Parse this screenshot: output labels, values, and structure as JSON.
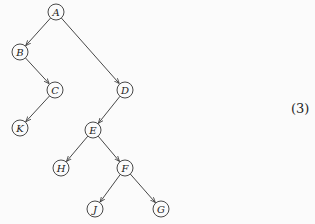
{
  "diagram": {
    "type": "binary-tree",
    "nodes": [
      {
        "id": "A",
        "label": "A",
        "x": 56,
        "y": 12
      },
      {
        "id": "B",
        "label": "B",
        "x": 20,
        "y": 52
      },
      {
        "id": "C",
        "label": "C",
        "x": 55,
        "y": 90
      },
      {
        "id": "K",
        "label": "K",
        "x": 20,
        "y": 128
      },
      {
        "id": "D",
        "label": "D",
        "x": 125,
        "y": 90
      },
      {
        "id": "E",
        "label": "E",
        "x": 93,
        "y": 130
      },
      {
        "id": "H",
        "label": "H",
        "x": 61,
        "y": 168
      },
      {
        "id": "F",
        "label": "F",
        "x": 125,
        "y": 168
      },
      {
        "id": "J",
        "label": "J",
        "x": 95,
        "y": 209
      },
      {
        "id": "G",
        "label": "G",
        "x": 161,
        "y": 209
      }
    ],
    "edges": [
      {
        "from": "A",
        "to": "B"
      },
      {
        "from": "A",
        "to": "D"
      },
      {
        "from": "B",
        "to": "C"
      },
      {
        "from": "C",
        "to": "K"
      },
      {
        "from": "D",
        "to": "E"
      },
      {
        "from": "E",
        "to": "H"
      },
      {
        "from": "E",
        "to": "F"
      },
      {
        "from": "F",
        "to": "J"
      },
      {
        "from": "F",
        "to": "G"
      }
    ],
    "equation_number": "(3)"
  }
}
